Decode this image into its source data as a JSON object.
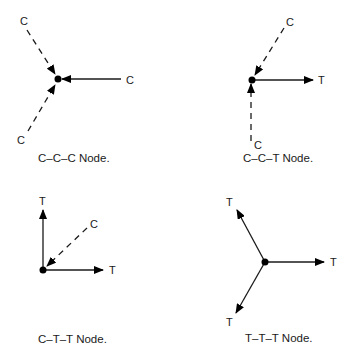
{
  "figure": {
    "colors": {
      "ink": "#1a1a1a",
      "background": "#ffffff"
    },
    "legend": {
      "compression_style": "dashed line, arrow pointing toward node",
      "tension_style": "solid line, arrow pointing away from node"
    },
    "panels": [
      {
        "id": "ccc",
        "caption": "C–C–C Node.",
        "members": [
          {
            "label": "C",
            "type": "compression",
            "direction": "upper-left"
          },
          {
            "label": "C",
            "type": "compression",
            "direction": "right"
          },
          {
            "label": "C",
            "type": "compression",
            "direction": "lower-left"
          }
        ]
      },
      {
        "id": "cct",
        "caption": "C–C–T Node.",
        "members": [
          {
            "label": "C",
            "type": "compression",
            "direction": "upper-right"
          },
          {
            "label": "T",
            "type": "tension",
            "direction": "right"
          },
          {
            "label": "C",
            "type": "compression",
            "direction": "down"
          }
        ]
      },
      {
        "id": "ctt",
        "caption": "C–T–T Node.",
        "members": [
          {
            "label": "T",
            "type": "tension",
            "direction": "up"
          },
          {
            "label": "C",
            "type": "compression",
            "direction": "upper-right"
          },
          {
            "label": "T",
            "type": "tension",
            "direction": "right"
          }
        ]
      },
      {
        "id": "ttt",
        "caption": "T–T–T Node.",
        "members": [
          {
            "label": "T",
            "type": "tension",
            "direction": "upper-left"
          },
          {
            "label": "T",
            "type": "tension",
            "direction": "right"
          },
          {
            "label": "T",
            "type": "tension",
            "direction": "lower-left"
          }
        ]
      }
    ]
  }
}
